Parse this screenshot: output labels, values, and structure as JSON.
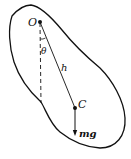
{
  "diagram": {
    "labels": {
      "pivot": "O",
      "angle": "θ",
      "distance": "h",
      "center_of_mass": "C",
      "weight": "mg"
    },
    "colors": {
      "stroke": "#111111",
      "background": "#ffffff"
    }
  }
}
